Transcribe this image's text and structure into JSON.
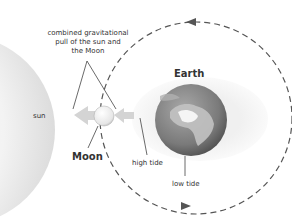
{
  "labels": {
    "combined_line1": "combined gravitational",
    "combined_line2": "pull of the sun and",
    "combined_line3": "the Moon",
    "sun": "sun",
    "moon": "Moon",
    "earth": "Earth",
    "high_tide": "high tide",
    "low_tide": "low tide"
  },
  "colors": {
    "background": "#ffffff",
    "sun_fill": "#eeeeee",
    "arrow_fill": "#d4d4d4",
    "orbit_stroke": "#555555",
    "tide_bulge": "#f2f2f2",
    "earth_fill": "#7d7d7d",
    "land_fill": "#bdbdbd",
    "text": "#333333"
  },
  "orbit": {
    "direction": "counterclockwise",
    "style": "dashed"
  }
}
